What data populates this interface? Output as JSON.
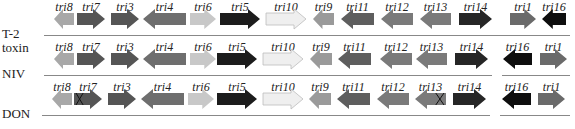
{
  "diagram": {
    "type": "gene_cluster",
    "colors": {
      "tri8": "#a8a8a8",
      "tri7": "#555555",
      "tri3": "#555555",
      "tri4": "#6e6e6e",
      "tri6": "#c8c8c8",
      "tri5": "#1c1c1c",
      "tri10": "#efefef",
      "tri9": "#9a9a9a",
      "tri11": "#5e5e5e",
      "tri12": "#7a7a7a",
      "tri13": "#7a7a7a",
      "tri14": "#262626",
      "tri1": "#6a6a6a",
      "tri16": "#0e0e0e",
      "line": "#888888"
    },
    "rows": [
      {
        "label": "T-2\ntoxin",
        "label_lines": [
          "T-2",
          "toxin"
        ],
        "top": 0,
        "segments": [
          [
            44,
            500
          ],
          [
            500,
            570
          ]
        ],
        "genes": [
          {
            "name": "tri8",
            "dir": "left",
            "x": 54,
            "w": 20,
            "disrupted": false
          },
          {
            "name": "tri7",
            "dir": "right",
            "x": 77,
            "w": 28,
            "disrupted": false
          },
          {
            "name": "tri3",
            "dir": "right",
            "x": 111,
            "w": 28,
            "disrupted": false
          },
          {
            "name": "tri4",
            "dir": "left",
            "x": 143,
            "w": 43,
            "disrupted": false
          },
          {
            "name": "tri6",
            "dir": "right",
            "x": 190,
            "w": 26,
            "disrupted": false
          },
          {
            "name": "tri5",
            "dir": "right",
            "x": 220,
            "w": 40,
            "disrupted": false
          },
          {
            "name": "tri10",
            "dir": "right",
            "x": 266,
            "w": 40,
            "disrupted": false
          },
          {
            "name": "tri9",
            "dir": "left",
            "x": 313,
            "w": 21,
            "disrupted": false
          },
          {
            "name": "tri11",
            "dir": "left",
            "x": 341,
            "w": 33,
            "disrupted": false
          },
          {
            "name": "tri12",
            "dir": "left",
            "x": 381,
            "w": 32,
            "disrupted": false
          },
          {
            "name": "tri13",
            "dir": "left",
            "x": 420,
            "w": 31,
            "disrupted": false
          },
          {
            "name": "tri14",
            "dir": "right",
            "x": 459,
            "w": 33,
            "disrupted": false
          },
          {
            "name": "tri1",
            "dir": "right",
            "x": 510,
            "w": 26,
            "disrupted": false
          },
          {
            "name": "tri16",
            "dir": "left",
            "x": 542,
            "w": 24,
            "disrupted": false
          }
        ]
      },
      {
        "label": "NIV",
        "label_lines": [
          "NIV"
        ],
        "top": 40,
        "segments": [
          [
            44,
            492
          ],
          [
            502,
            570
          ]
        ],
        "genes": [
          {
            "name": "tri8",
            "dir": "left",
            "x": 54,
            "w": 20,
            "disrupted": false
          },
          {
            "name": "tri7",
            "dir": "right",
            "x": 77,
            "w": 28,
            "disrupted": false
          },
          {
            "name": "tri3",
            "dir": "right",
            "x": 111,
            "w": 28,
            "disrupted": false
          },
          {
            "name": "tri4",
            "dir": "left",
            "x": 143,
            "w": 43,
            "disrupted": false
          },
          {
            "name": "tri6",
            "dir": "right",
            "x": 190,
            "w": 26,
            "disrupted": false
          },
          {
            "name": "tri5",
            "dir": "right",
            "x": 217,
            "w": 40,
            "disrupted": false
          },
          {
            "name": "tri10",
            "dir": "right",
            "x": 263,
            "w": 40,
            "disrupted": false
          },
          {
            "name": "tri9",
            "dir": "left",
            "x": 310,
            "w": 22,
            "disrupted": false
          },
          {
            "name": "tri11",
            "dir": "left",
            "x": 338,
            "w": 33,
            "disrupted": false
          },
          {
            "name": "tri12",
            "dir": "left",
            "x": 380,
            "w": 32,
            "disrupted": false
          },
          {
            "name": "tri13",
            "dir": "left",
            "x": 416,
            "w": 31,
            "disrupted": false
          },
          {
            "name": "tri14",
            "dir": "right",
            "x": 455,
            "w": 33,
            "disrupted": false
          },
          {
            "name": "tri16",
            "dir": "left",
            "x": 503,
            "w": 29,
            "disrupted": false
          },
          {
            "name": "tri1",
            "dir": "right",
            "x": 540,
            "w": 27,
            "disrupted": false
          }
        ]
      },
      {
        "label": "DON",
        "label_lines": [
          "DON"
        ],
        "top": 80,
        "segments": [
          [
            42,
            490
          ],
          [
            500,
            570
          ]
        ],
        "genes": [
          {
            "name": "tri8",
            "dir": "left",
            "x": 52,
            "w": 20,
            "disrupted": false
          },
          {
            "name": "tri7",
            "dir": "right",
            "x": 74,
            "w": 28,
            "disrupted": true
          },
          {
            "name": "tri3",
            "dir": "right",
            "x": 108,
            "w": 28,
            "disrupted": false
          },
          {
            "name": "tri4",
            "dir": "left",
            "x": 141,
            "w": 43,
            "disrupted": false
          },
          {
            "name": "tri6",
            "dir": "right",
            "x": 188,
            "w": 26,
            "disrupted": false
          },
          {
            "name": "tri5",
            "dir": "right",
            "x": 217,
            "w": 40,
            "disrupted": false
          },
          {
            "name": "tri10",
            "dir": "right",
            "x": 263,
            "w": 40,
            "disrupted": false
          },
          {
            "name": "tri9",
            "dir": "left",
            "x": 309,
            "w": 22,
            "disrupted": false
          },
          {
            "name": "tri11",
            "dir": "left",
            "x": 337,
            "w": 33,
            "disrupted": false
          },
          {
            "name": "tri12",
            "dir": "left",
            "x": 377,
            "w": 32,
            "disrupted": false
          },
          {
            "name": "tri13",
            "dir": "left",
            "x": 415,
            "w": 31,
            "disrupted": true
          },
          {
            "name": "tri14",
            "dir": "right",
            "x": 453,
            "w": 33,
            "disrupted": false
          },
          {
            "name": "tri16",
            "dir": "left",
            "x": 502,
            "w": 29,
            "disrupted": false
          },
          {
            "name": "tri1",
            "dir": "right",
            "x": 538,
            "w": 27,
            "disrupted": false
          }
        ]
      }
    ]
  }
}
